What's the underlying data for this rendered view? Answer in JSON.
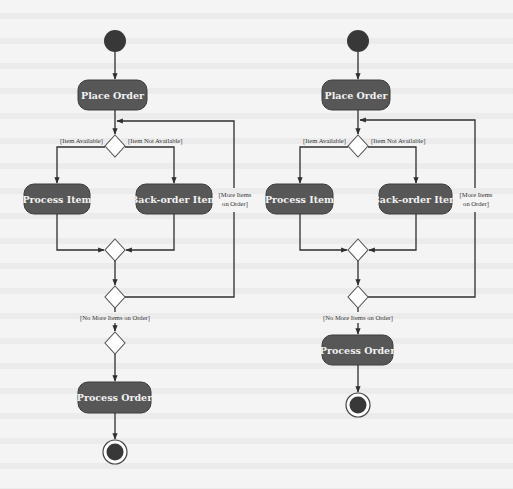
{
  "colors": {
    "background": "#f4f4f4",
    "action_fill": "#575757",
    "action_text": "#f2f2f2",
    "initial_node": "#383838",
    "edge": "#2e2e2e",
    "decision_fill": "#ffffff"
  },
  "diagrams": [
    {
      "id": "left",
      "actions": {
        "place_order": "Place Order",
        "process_item": "Process Item",
        "backorder_item": "Back-order Item",
        "process_order": "Process Order"
      },
      "guards": {
        "item_available": "[Item Available]",
        "item_not_available": "[Item Not Available]",
        "more_items_line1": "[More Items",
        "more_items_line2": "on Order]",
        "no_more_items": "[No More Items on Order]"
      },
      "decision_nodes": 3,
      "has_initial_node": true,
      "has_final_node": true
    },
    {
      "id": "right",
      "actions": {
        "place_order": "Place Order",
        "process_item": "Process Item",
        "backorder_item": "Back-order Item",
        "process_order": "Process Order"
      },
      "guards": {
        "item_available": "[Item Available]",
        "item_not_available": "[Item Not Available]",
        "more_items_line1": "[More Items",
        "more_items_line2": "on Order]",
        "no_more_items": "[No More Items on Order]"
      },
      "decision_nodes": 2,
      "has_initial_node": true,
      "has_final_node": true
    }
  ]
}
